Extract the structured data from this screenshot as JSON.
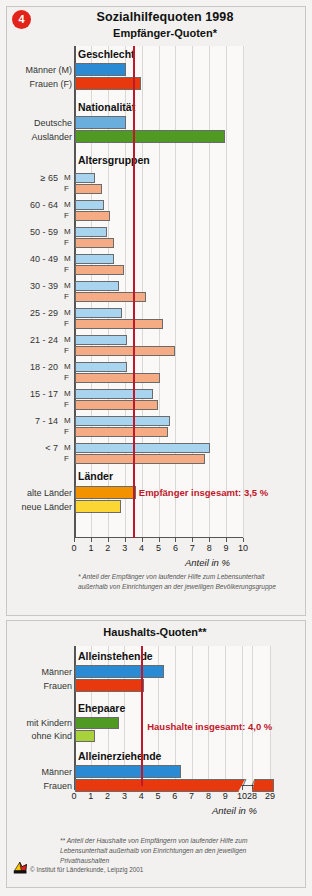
{
  "badge": "4",
  "title": "Sozialhilfequoten 1998",
  "credit": "© Institut für Länderkunde, Leipzig 2001",
  "chart_data": [
    {
      "type": "bar",
      "orientation": "horizontal",
      "title": "Empfänger-Quoten*",
      "xlabel": "Anteil in %",
      "ylabel": "",
      "xlim": [
        0,
        10
      ],
      "xticks": [
        "0",
        "1",
        "2",
        "3",
        "4",
        "5",
        "6",
        "7",
        "8",
        "9",
        "10"
      ],
      "grid": true,
      "reference_line": {
        "value": 3.5,
        "label": "Empfänger insgesamt: 3,5 %",
        "color": "#c0172b"
      },
      "footnote": "* Anteil der Empfänger von laufender Hilfe zum Lebensunterhalt außerhalb von Einrichtungen an der jeweiligen Bevölkerungsgruppe",
      "groups": [
        {
          "name": "Geschlecht",
          "bars": [
            {
              "label": "Männer (M)",
              "sub": "",
              "value": 3.0,
              "color": "#2a8ad4"
            },
            {
              "label": "Frauen (F)",
              "sub": "",
              "value": 3.9,
              "color": "#e8380d"
            }
          ]
        },
        {
          "name": "Nationalität",
          "bars": [
            {
              "label": "Deutsche",
              "sub": "",
              "value": 3.0,
              "color": "#6aaede"
            },
            {
              "label": "Ausländer",
              "sub": "",
              "value": 8.9,
              "color": "#4f9a22"
            }
          ]
        },
        {
          "name": "Altersgruppen",
          "bars": [
            {
              "label": "≥ 65",
              "sub": "M",
              "value": 1.2,
              "color": "#a8d4f0"
            },
            {
              "label": "",
              "sub": "F",
              "value": 1.6,
              "color": "#f5ab84"
            },
            {
              "label": "60 - 64",
              "sub": "M",
              "value": 1.7,
              "color": "#a8d4f0"
            },
            {
              "label": "",
              "sub": "F",
              "value": 2.1,
              "color": "#f5ab84"
            },
            {
              "label": "50 - 59",
              "sub": "M",
              "value": 1.9,
              "color": "#a8d4f0"
            },
            {
              "label": "",
              "sub": "F",
              "value": 2.3,
              "color": "#f5ab84"
            },
            {
              "label": "40 - 49",
              "sub": "M",
              "value": 2.3,
              "color": "#a8d4f0"
            },
            {
              "label": "",
              "sub": "F",
              "value": 2.9,
              "color": "#f5ab84"
            },
            {
              "label": "30 - 39",
              "sub": "M",
              "value": 2.6,
              "color": "#a8d4f0"
            },
            {
              "label": "",
              "sub": "F",
              "value": 4.2,
              "color": "#f5ab84"
            },
            {
              "label": "25 - 29",
              "sub": "M",
              "value": 2.8,
              "color": "#a8d4f0"
            },
            {
              "label": "",
              "sub": "F",
              "value": 5.2,
              "color": "#f5ab84"
            },
            {
              "label": "21 - 24",
              "sub": "M",
              "value": 3.1,
              "color": "#a8d4f0"
            },
            {
              "label": "",
              "sub": "F",
              "value": 5.9,
              "color": "#f5ab84"
            },
            {
              "label": "18 - 20",
              "sub": "M",
              "value": 3.1,
              "color": "#a8d4f0"
            },
            {
              "label": "",
              "sub": "F",
              "value": 5.0,
              "color": "#f5ab84"
            },
            {
              "label": "15 - 17",
              "sub": "M",
              "value": 4.6,
              "color": "#a8d4f0"
            },
            {
              "label": "",
              "sub": "F",
              "value": 4.9,
              "color": "#f5ab84"
            },
            {
              "label": "7 - 14",
              "sub": "M",
              "value": 5.6,
              "color": "#a8d4f0"
            },
            {
              "label": "",
              "sub": "F",
              "value": 5.5,
              "color": "#f5ab84"
            },
            {
              "label": "< 7",
              "sub": "M",
              "value": 8.0,
              "color": "#a8d4f0"
            },
            {
              "label": "",
              "sub": "F",
              "value": 7.7,
              "color": "#f5ab84"
            }
          ]
        },
        {
          "name": "Länder",
          "bars": [
            {
              "label": "alte Länder",
              "sub": "",
              "value": 3.6,
              "color": "#f39200"
            },
            {
              "label": "neue Länder",
              "sub": "",
              "value": 2.7,
              "color": "#fcd733"
            }
          ]
        }
      ]
    },
    {
      "type": "bar",
      "orientation": "horizontal",
      "title": "Haushalts-Quoten**",
      "xlabel": "Anteil in %",
      "ylabel": "",
      "xlim": [
        0,
        10
      ],
      "xticks": [
        "0",
        "1",
        "2",
        "3",
        "4",
        "5",
        "6",
        "7",
        "8",
        "9",
        "10",
        "28",
        "29"
      ],
      "axis_break": true,
      "grid": true,
      "reference_line": {
        "value": 4.0,
        "label": "Haushalte insgesamt: 4,0 %",
        "color": "#c0172b"
      },
      "footnote": "** Anteil der Haushalte von Empfängern von laufender Hilfe zum Lebensunterhalt außerhalb von Einrichtungen an den jeweiligen Privathaushalten",
      "groups": [
        {
          "name": "Alleinstehende",
          "bars": [
            {
              "label": "Männer",
              "sub": "",
              "value": 5.3,
              "color": "#2a8ad4"
            },
            {
              "label": "Frauen",
              "sub": "",
              "value": 4.1,
              "color": "#e8380d"
            }
          ]
        },
        {
          "name": "Ehepaare",
          "bars": [
            {
              "label": "mit Kindern",
              "sub": "",
              "value": 2.6,
              "color": "#4f9a22"
            },
            {
              "label": "ohne Kind",
              "sub": "",
              "value": 1.2,
              "color": "#a8d13a"
            }
          ]
        },
        {
          "name": "Alleinerziehende",
          "bars": [
            {
              "label": "Männer",
              "sub": "",
              "value": 6.3,
              "color": "#2a8ad4"
            },
            {
              "label": "Frauen",
              "sub": "",
              "value": 28.2,
              "color": "#e8380d"
            }
          ]
        }
      ]
    }
  ]
}
